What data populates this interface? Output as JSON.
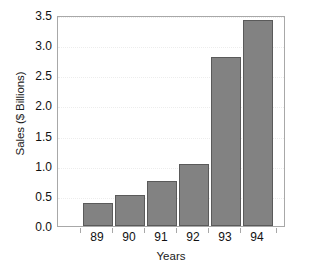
{
  "chart_data": {
    "type": "bar",
    "title": "",
    "xlabel": "Years",
    "ylabel": "Sales ($ Billions)",
    "categories": [
      "89",
      "90",
      "91",
      "92",
      "93",
      "94"
    ],
    "values": [
      0.38,
      0.52,
      0.75,
      1.03,
      2.81,
      3.41
    ],
    "ylim": [
      0.0,
      3.5
    ],
    "ytick_labels": [
      "0.0",
      "0.5",
      "1.0",
      "1.5",
      "2.0",
      "2.5",
      "3.0",
      "3.5"
    ],
    "ytick_values": [
      0.0,
      0.5,
      1.0,
      1.5,
      2.0,
      2.5,
      3.0,
      3.5
    ],
    "grid": true,
    "grid_axis": "y",
    "legend": false,
    "legend_position": "none",
    "bar_color": "#828282",
    "bar_edge_color": "#5a5a5a",
    "grid_color": "#ededed",
    "axis_color": "#a8a8a8",
    "text_color": "#111111",
    "background": "#ffffff"
  }
}
